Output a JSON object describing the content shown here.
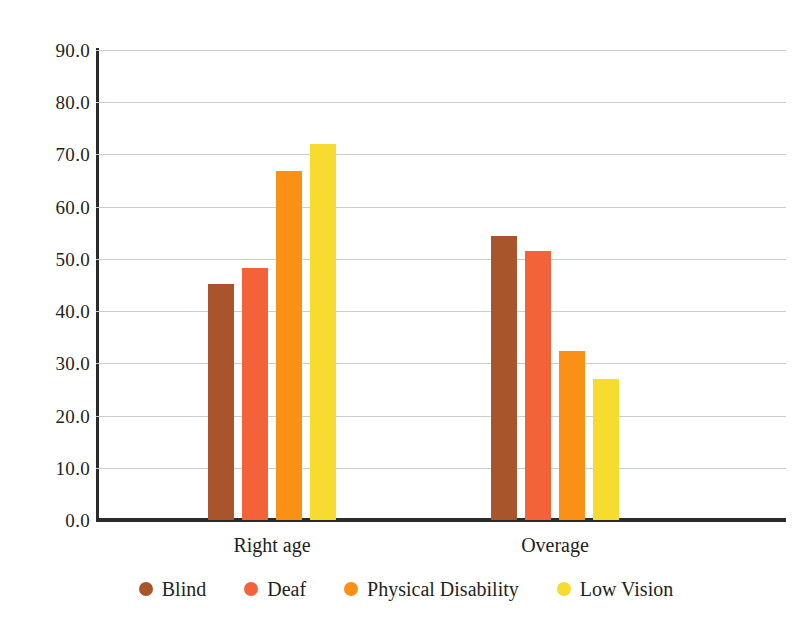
{
  "chart_data": {
    "type": "bar",
    "title": "",
    "xlabel": "",
    "ylabel": "",
    "categories": [
      "Right age",
      "Overage"
    ],
    "series": [
      {
        "name": "Blind",
        "color": "#A9552C",
        "values": [
          45.2,
          54.4
        ]
      },
      {
        "name": "Deaf",
        "color": "#F4623A",
        "values": [
          48.2,
          51.6
        ]
      },
      {
        "name": "Physical Disability",
        "color": "#FA9016",
        "values": [
          66.8,
          32.4
        ]
      },
      {
        "name": "Low Vision",
        "color": "#F7DB2F",
        "values": [
          72.0,
          27.0
        ]
      }
    ],
    "ylim": [
      0.0,
      90.0
    ],
    "ytick_step": 10.0,
    "ytick_labels": [
      "0.0",
      "10.0",
      "20.0",
      "30.0",
      "40.0",
      "50.0",
      "60.0",
      "70.0",
      "80.0",
      "90.0"
    ],
    "grid": true,
    "grid_color": "#c9ccd4",
    "axis_color": "#2b2b2b",
    "legend_position": "bottom",
    "background": "#ffffff"
  },
  "legend": {
    "items": [
      {
        "label": "Blind",
        "color": "#A9552C"
      },
      {
        "label": "Deaf",
        "color": "#F4623A"
      },
      {
        "label": "Physical Disability",
        "color": "#FA9016"
      },
      {
        "label": "Low Vision",
        "color": "#F7DB2F"
      }
    ]
  },
  "axis": {
    "categories": [
      "Right age",
      "Overage"
    ]
  }
}
